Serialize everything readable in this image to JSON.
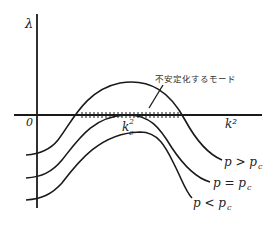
{
  "diagram": {
    "axes": {
      "y_label": "λ",
      "x_label": "k²",
      "origin_label": "0"
    },
    "critical_wavenumber_label": "k_c²",
    "critical_wavenumber_base": "k",
    "critical_wavenumber_sub": "c",
    "critical_wavenumber_sup": "2",
    "annotation": "不安定化するモード",
    "curves": [
      {
        "id": "p-gt-pc",
        "label": "p > pc",
        "label_main": "p > p",
        "label_sub": "c"
      },
      {
        "id": "p-eq-pc",
        "label": "p = pc",
        "label_main": "p = p",
        "label_sub": "c"
      },
      {
        "id": "p-lt-pc",
        "label": "p < pc",
        "label_main": "p < p",
        "label_sub": "c"
      }
    ],
    "colors": {
      "line": "#1a1a1a",
      "background": "#ffffff"
    }
  }
}
